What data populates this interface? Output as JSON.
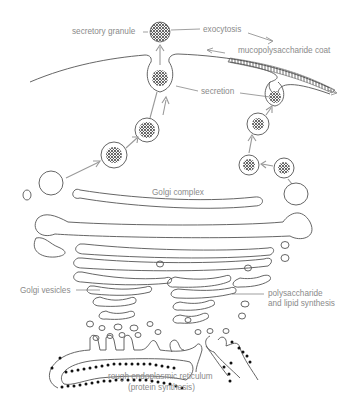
{
  "figure": {
    "background": "#ffffff",
    "line_color": "#555555",
    "label_color": "#8a8a8a",
    "arrow_color": "#999999"
  },
  "labels": {
    "secretory_granule": "secretory granule",
    "exocytosis": "exocytosis",
    "mucopolysaccharide_coat": "mucopolysaccharide coat",
    "secretion": "secretion",
    "golgi_complex": "Golgi complex",
    "golgi_vesicles": "Golgi vesicles",
    "polysaccharide_line1": "polysaccharide",
    "polysaccharide_line2": "and lipid synthesis",
    "rer_line1": "rough endoplasmic reticulum",
    "rer_line2": "(protein synthesis)"
  },
  "structures": [
    {
      "name": "cell-membrane",
      "description": "plasma membrane curving across top"
    },
    {
      "name": "secretory-granule",
      "description": "released granule above membrane"
    },
    {
      "name": "secretory-vesicles-left",
      "count": 3
    },
    {
      "name": "secretory-vesicles-right",
      "count": 3
    },
    {
      "name": "golgi-cisternae",
      "description": "stack of flattened membrane sacs"
    },
    {
      "name": "golgi-vesicles",
      "description": "small vesicles budding from stack"
    },
    {
      "name": "rough-er",
      "description": "membrane with ribosome dots"
    }
  ]
}
